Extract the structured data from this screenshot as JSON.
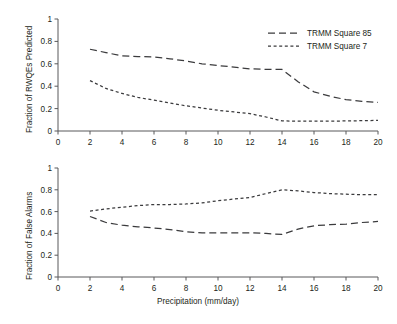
{
  "figure": {
    "background": "#ffffff",
    "line_color": "#3b3b3d",
    "axis_color": "#58595b",
    "text_color": "#231f20"
  },
  "legend": {
    "position": "top-right-of-upper-panel",
    "entries": [
      {
        "label": "TRMM Square 85",
        "dash": "long"
      },
      {
        "label": "TRMM Square 7",
        "dash": "short"
      }
    ]
  },
  "xaxis": {
    "title": "Precipitation (mm/day)",
    "ticks": [
      "0",
      "2",
      "4",
      "6",
      "8",
      "10",
      "12",
      "14",
      "16",
      "18",
      "20"
    ],
    "min": 0,
    "max": 20
  },
  "yaxis": {
    "ticks": [
      "0",
      "0.2",
      "0.4",
      "0.6",
      "0.8",
      "1"
    ],
    "min": 0,
    "max": 1
  },
  "panels": {
    "top": {
      "ylabel": "Fraction of RWQEs Predicted"
    },
    "bottom": {
      "ylabel": "Fraction of False Alarms"
    }
  },
  "chart_data": [
    {
      "type": "line",
      "title": "",
      "xlabel": "",
      "ylabel": "Fraction of RWQEs Predicted",
      "xlim": [
        0,
        20
      ],
      "ylim": [
        0,
        1
      ],
      "xticks": [
        0,
        2,
        4,
        6,
        8,
        10,
        12,
        14,
        16,
        18,
        20
      ],
      "yticks": [
        0,
        0.2,
        0.4,
        0.6,
        0.8,
        1
      ],
      "grid": false,
      "legend": "upper right",
      "x": [
        2,
        3,
        4,
        5,
        6,
        7,
        8,
        9,
        10,
        11,
        12,
        13,
        14,
        15,
        16,
        17,
        18,
        19,
        20
      ],
      "series": [
        {
          "name": "TRMM Square 85",
          "dash": "long",
          "values": [
            0.73,
            0.7,
            0.67,
            0.665,
            0.66,
            0.645,
            0.625,
            0.6,
            0.585,
            0.57,
            0.555,
            0.55,
            0.55,
            0.44,
            0.35,
            0.31,
            0.28,
            0.265,
            0.255
          ]
        },
        {
          "name": "TRMM Square 7",
          "dash": "short",
          "values": [
            0.45,
            0.38,
            0.335,
            0.3,
            0.275,
            0.25,
            0.225,
            0.205,
            0.185,
            0.17,
            0.155,
            0.125,
            0.09,
            0.088,
            0.088,
            0.088,
            0.09,
            0.092,
            0.095
          ]
        }
      ]
    },
    {
      "type": "line",
      "title": "",
      "xlabel": "Precipitation (mm/day)",
      "ylabel": "Fraction of False Alarms",
      "xlim": [
        0,
        20
      ],
      "ylim": [
        0,
        1
      ],
      "xticks": [
        0,
        2,
        4,
        6,
        8,
        10,
        12,
        14,
        16,
        18,
        20
      ],
      "yticks": [
        0,
        0.2,
        0.4,
        0.6,
        0.8,
        1
      ],
      "grid": false,
      "legend": "none",
      "x": [
        2,
        3,
        4,
        5,
        6,
        7,
        8,
        9,
        10,
        11,
        12,
        13,
        14,
        15,
        16,
        17,
        18,
        19,
        20
      ],
      "series": [
        {
          "name": "TRMM Square 85",
          "dash": "long",
          "values": [
            0.555,
            0.5,
            0.475,
            0.46,
            0.45,
            0.435,
            0.415,
            0.405,
            0.405,
            0.405,
            0.405,
            0.4,
            0.39,
            0.44,
            0.47,
            0.48,
            0.485,
            0.5,
            0.51
          ]
        },
        {
          "name": "TRMM Square 7",
          "dash": "short",
          "values": [
            0.605,
            0.625,
            0.64,
            0.655,
            0.665,
            0.665,
            0.67,
            0.68,
            0.7,
            0.715,
            0.73,
            0.765,
            0.8,
            0.79,
            0.775,
            0.765,
            0.76,
            0.755,
            0.755
          ]
        }
      ]
    }
  ]
}
